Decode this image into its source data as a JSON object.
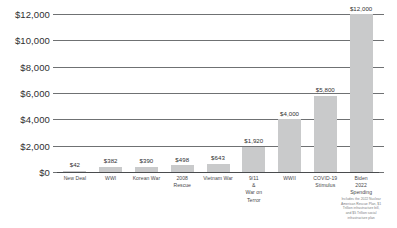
{
  "chart_data": {
    "type": "bar",
    "title": "",
    "xlabel": "",
    "ylabel": "",
    "ylim": [
      0,
      12000
    ],
    "grid": true,
    "legend": "none",
    "y_ticks": [
      "$0",
      "$2,000",
      "$4,000",
      "$6,000",
      "$8,000",
      "$10,000",
      "$12,000"
    ],
    "y_tick_values": [
      0,
      2000,
      4000,
      6000,
      8000,
      10000,
      12000
    ],
    "categories": [
      "New Deal",
      "WWI",
      "Korean War",
      "2008\nRescue",
      "Vietnam War",
      "9/11\n&\nWar on\nTerror",
      "WWII",
      "COVID-19\nStimulus",
      "Biden\n2022\nSpending"
    ],
    "values": [
      42,
      382,
      390,
      498,
      643,
      1920,
      4000,
      5800,
      12000
    ],
    "data_labels": [
      "$42",
      "$382",
      "$390",
      "$498",
      "$643",
      "$1,920",
      "$4,000",
      "$5,800",
      "$12,000"
    ],
    "annotations": [
      {
        "target": "Biden 2022 Spending",
        "text": "Includes the 2022 Nuclear\nAmerican Rescue Plan, $1\nTrillion infrastructure bill,\nand $5 Trillion social\ninfrastructure plan"
      }
    ],
    "colors": {
      "bar_fill": "#c9cacb",
      "gridline": "#6f7173",
      "axis_text": "#2f2f31",
      "category_text": "#47484a",
      "footnote_text": "#7b7d7f",
      "background": "#ffffff"
    }
  }
}
